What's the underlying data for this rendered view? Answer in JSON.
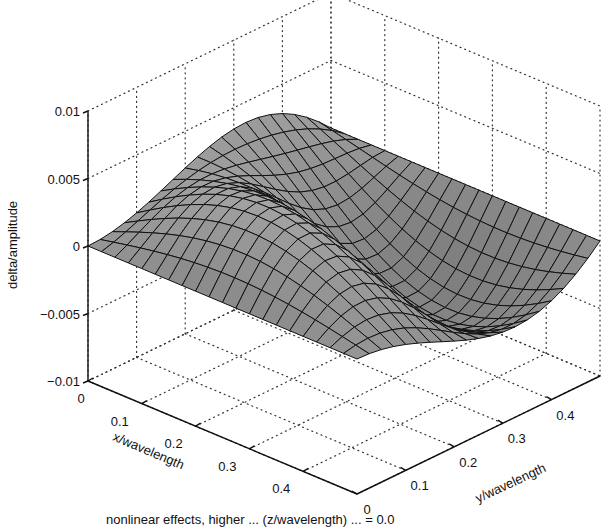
{
  "chart_data": {
    "type": "surface3d",
    "title": "",
    "xlabel": "x/wavelength",
    "ylabel": "y/wavelength",
    "zlabel": "delta/amplitude",
    "xlim": [
      0,
      0.5
    ],
    "ylim": [
      0,
      0.5
    ],
    "zlim": [
      -0.01,
      0.01
    ],
    "x_ticks": [
      "0",
      "0.1",
      "0.2",
      "0.3",
      "0.4"
    ],
    "y_ticks": [
      "0",
      "0.1",
      "0.2",
      "0.3",
      "0.4"
    ],
    "z_ticks": [
      "0.01",
      "0.005",
      "0",
      "−0.005",
      "−0.01"
    ],
    "grid": true,
    "grid_style": "dotted",
    "colormap": "grayscale shaded mesh",
    "grid_resolution": [
      20,
      20
    ],
    "surface_description": "Wave-like surface: near zero at x=0,y=0 corner; small ridge (~+0.004) and trough (~-0.004) at small y across x; large ridge peaking ~+0.008 near x~0.15,y~0.35 and deep trough ~-0.009 near x~0.4,y~0.3",
    "peak_max": 0.008,
    "peak_min": -0.009
  },
  "caption": "nonlinear effects, higher ... (z/wavelength) ... = 0.0"
}
